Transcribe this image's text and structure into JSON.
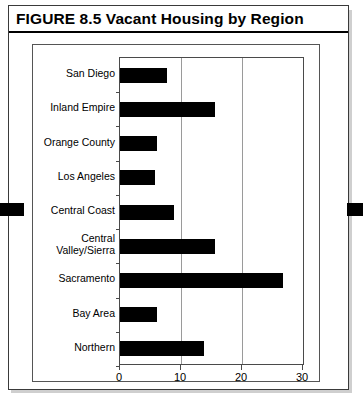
{
  "figure": {
    "label": "FIGURE 8.5",
    "title": "Vacant Housing by Region",
    "full_title": "FIGURE 8.5   Vacant Housing by Region"
  },
  "axis": {
    "unit_symbol": "%",
    "tick_labels": [
      "0",
      "10",
      "20",
      "30"
    ]
  },
  "colors": {
    "bar": "#000000",
    "grid": "#9a9a9a",
    "frame": "#4a4a4a",
    "text": "#000000",
    "background": "#ffffff"
  },
  "chart_data": {
    "type": "bar",
    "orientation": "horizontal",
    "title": "Vacant Housing by Region",
    "xlabel": "%",
    "ylabel": "",
    "xlim": [
      0,
      30
    ],
    "xticks": [
      0,
      10,
      20,
      30
    ],
    "grid": true,
    "legend": "none",
    "categories": [
      "San Diego",
      "Inland Empire",
      "Orange County",
      "Los Angeles",
      "Central Coast",
      "Central Valley/Sierra",
      "Sacramento",
      "Bay Area",
      "Northern"
    ],
    "values": [
      7.7,
      15.5,
      6.0,
      5.7,
      8.8,
      15.5,
      26.8,
      6.0,
      13.8
    ]
  }
}
